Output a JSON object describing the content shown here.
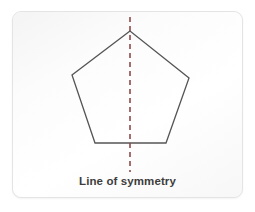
{
  "figure": {
    "kind": "geometry-diagram",
    "caption": "Line of symmetry",
    "card": {
      "background_color": "#fbfbfb",
      "border_color": "#e4e4e4"
    },
    "canvas_background_color": "#ffffff"
  },
  "shape": {
    "name": "pentagon",
    "sides": 5,
    "stroke_color": "#555555",
    "stroke_width": 1.3,
    "fill": "none",
    "points": "130,31 72,75 95,143 166,143 189,78",
    "vertices": [
      {
        "label": "apex",
        "x": 130,
        "y": 31
      },
      {
        "label": "upper-left",
        "x": 72,
        "y": 75
      },
      {
        "label": "lower-left",
        "x": 95,
        "y": 143
      },
      {
        "label": "lower-right",
        "x": 166,
        "y": 143
      },
      {
        "label": "upper-right",
        "x": 189,
        "y": 78
      }
    ]
  },
  "symmetry_line": {
    "label": "Line of symmetry",
    "orientation": "vertical",
    "color": "#8e4a4a",
    "stroke_width": 1.6,
    "dash_pattern": "5,4",
    "x": 130,
    "y_start": 17,
    "y_end": 172
  },
  "caption": {
    "text": "Line of symmetry",
    "color": "#3d3d3d",
    "font_size_px": 11.5,
    "bold": true
  }
}
